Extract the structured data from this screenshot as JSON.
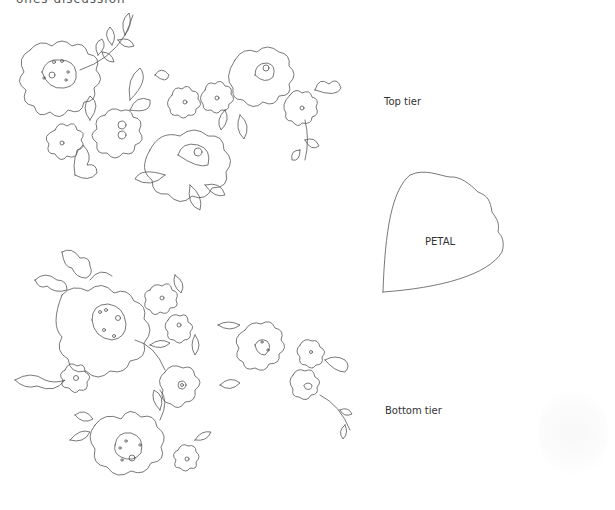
{
  "header": {
    "clipped_text": "ones discussion"
  },
  "labels": {
    "top_tier": "Top tier",
    "petal": "PETAL",
    "bottom_tier": "Bottom tier"
  },
  "colors": {
    "line": "#555555",
    "background": "#ffffff"
  }
}
